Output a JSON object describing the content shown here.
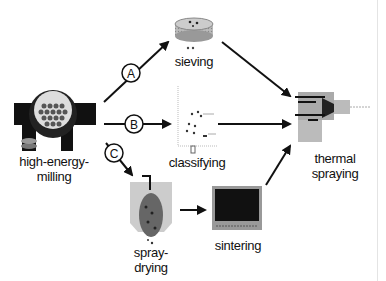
{
  "diagram": {
    "nodes": {
      "milling": {
        "label_line1": "high-energy-",
        "label_line2": "milling"
      },
      "sieving": {
        "label": "sieving"
      },
      "classifying": {
        "label": "classifying"
      },
      "spray_drying": {
        "label_line1": "spray-",
        "label_line2": "drying"
      },
      "sintering": {
        "label": "sintering"
      },
      "thermal_spraying": {
        "label_line1": "thermal",
        "label_line2": "spraying"
      }
    },
    "routes": [
      {
        "id": "A",
        "from": "milling",
        "to": "sieving"
      },
      {
        "id": "B",
        "from": "milling",
        "to": "classifying"
      },
      {
        "id": "C",
        "from": "milling",
        "to": "spray_drying"
      }
    ],
    "edges": [
      [
        "milling",
        "sieving"
      ],
      [
        "milling",
        "classifying"
      ],
      [
        "milling",
        "spray_drying"
      ],
      [
        "sieving",
        "thermal_spraying"
      ],
      [
        "classifying",
        "thermal_spraying"
      ],
      [
        "spray_drying",
        "sintering"
      ],
      [
        "sintering",
        "thermal_spraying"
      ]
    ]
  }
}
